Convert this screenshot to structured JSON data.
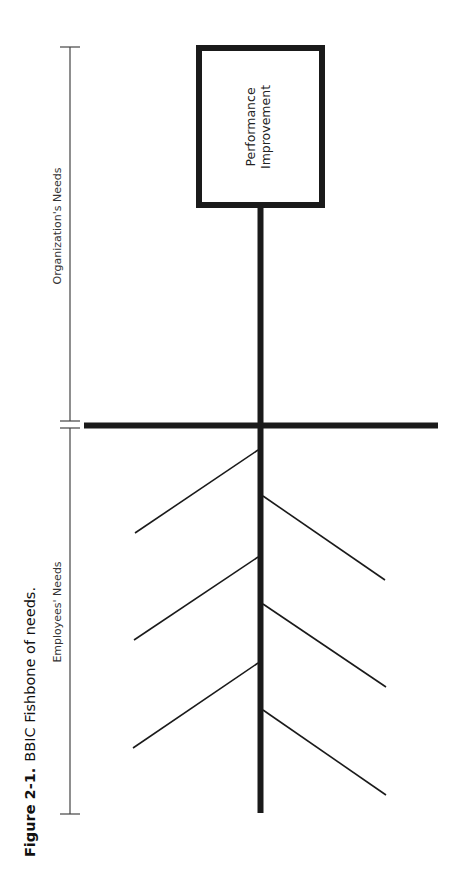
{
  "figure": {
    "caption_number": "Figure 2-1.",
    "caption_text": "BBIC Fishbone of needs."
  },
  "diagram": {
    "type": "fishbone",
    "head_box": {
      "line1": "Performance",
      "line2": "Improvement"
    },
    "brackets": {
      "upper_label": "Organization's Needs",
      "lower_label": "Employees' Needs"
    },
    "branches": {
      "left_count": 3,
      "right_count": 3
    },
    "colors": {
      "ink": "#1a1a1a",
      "background": "#ffffff"
    }
  }
}
